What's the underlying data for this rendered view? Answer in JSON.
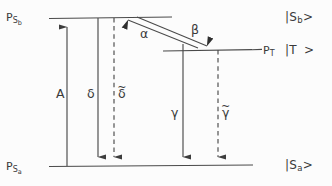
{
  "figure": {
    "type": "energy-level-diagram",
    "background_color": "#fcfcfc",
    "line_color": "#4a4a4a",
    "text_color": "#3a3a3a",
    "width": 332,
    "height": 186
  },
  "levels": [
    {
      "id": "s_b",
      "left_label": "P",
      "left_label_sub": "S",
      "left_label_subsub": "b",
      "right_ket": "|S",
      "right_ket_sub": "b",
      "right_ket_close": ">",
      "y": 18
    },
    {
      "id": "t",
      "left_label": "P",
      "left_label_sub": "T",
      "right_ket": "|T",
      "right_ket_sub": "",
      "right_ket_close": ">",
      "y": 50
    },
    {
      "id": "s_a",
      "left_label": "P",
      "left_label_sub": "S",
      "left_label_subsub": "a",
      "right_ket": "|S",
      "right_ket_sub": "a",
      "right_ket_close": ">",
      "y": 166
    }
  ],
  "transitions": [
    {
      "id": "A",
      "label": "A",
      "tilde": false,
      "style": "solid",
      "direction": "up",
      "x": 67
    },
    {
      "id": "delta",
      "label": "δ",
      "tilde": false,
      "style": "solid",
      "direction": "down",
      "x": 98
    },
    {
      "id": "delta_t",
      "label": "δ",
      "tilde": true,
      "style": "dashed",
      "direction": "down",
      "x": 114
    },
    {
      "id": "gamma",
      "label": "γ",
      "tilde": false,
      "style": "solid",
      "direction": "down",
      "x": 183
    },
    {
      "id": "gamma_t",
      "label": "γ",
      "tilde": true,
      "style": "dashed",
      "direction": "down",
      "x": 218
    },
    {
      "id": "alpha",
      "label": "α",
      "tilde": false,
      "style": "solid",
      "direction": "up-left",
      "x": 137
    },
    {
      "id": "beta",
      "label": "β",
      "tilde": false,
      "style": "solid",
      "direction": "down-right",
      "x": 198
    }
  ],
  "labels": {
    "p_s_b": {
      "base": "P",
      "sub": "S",
      "subsub": "b"
    },
    "p_s_a": {
      "base": "P",
      "sub": "S",
      "subsub": "a"
    },
    "p_t": {
      "base": "P",
      "sub": "T"
    },
    "ket_s_b": {
      "open": "|S",
      "sub": "b",
      "close": ">"
    },
    "ket_t": {
      "open": "|T",
      "sub": "",
      "close": ">"
    },
    "ket_s_a": {
      "open": "|S",
      "sub": "a",
      "close": ">"
    },
    "rate_A": "A",
    "rate_delta": "δ",
    "rate_delta_t": "δ",
    "rate_gamma": "γ",
    "rate_gamma_t": "γ",
    "rate_alpha": "α",
    "rate_beta": "β",
    "tilde_mark": "~"
  }
}
